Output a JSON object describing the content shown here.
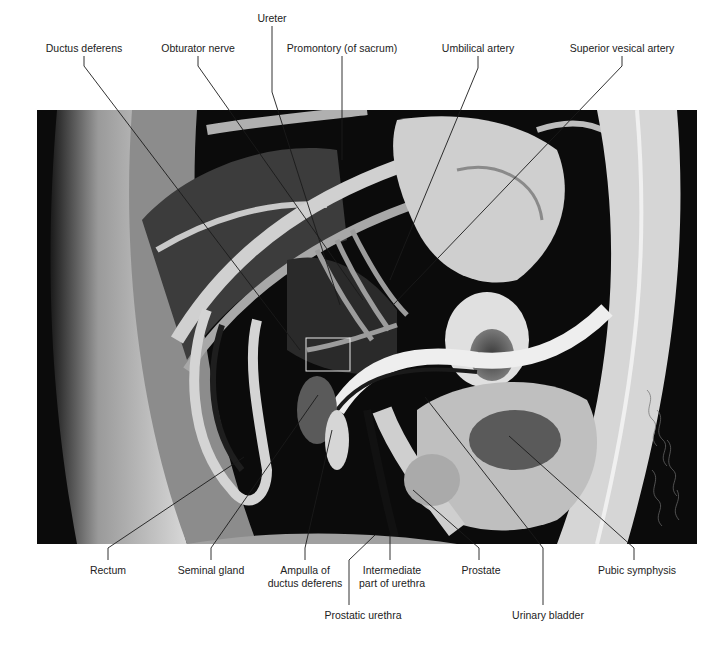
{
  "figure": {
    "type": "anatomical-photograph",
    "view": "median sagittal section of male pelvis",
    "labels_top": [
      {
        "id": "ductus-deferens",
        "text": "Ductus deferens",
        "x": 61,
        "y": 48
      },
      {
        "id": "obturator-nerve",
        "text": "Obturator nerve",
        "x": 198,
        "y": 48
      },
      {
        "id": "ureter",
        "text": "Ureter",
        "x": 272,
        "y": 18
      },
      {
        "id": "promontory",
        "text": "Promontory (of sacrum)",
        "x": 346,
        "y": 48
      },
      {
        "id": "umbilical-artery",
        "text": "Umbilical artery",
        "x": 479,
        "y": 48
      },
      {
        "id": "superior-vesical-artery",
        "text": "Superior vesical artery",
        "x": 626,
        "y": 48
      }
    ],
    "labels_bottom": [
      {
        "id": "rectum",
        "text": "Rectum",
        "x": 108,
        "y": 569
      },
      {
        "id": "seminal-gland",
        "text": "Seminal gland",
        "x": 211,
        "y": 569
      },
      {
        "id": "ampulla",
        "text": "Ampulla of",
        "text2": "ductus deferens",
        "x": 303,
        "y": 569
      },
      {
        "id": "prostatic-urethra",
        "text": "Prostatic urethra",
        "x": 363,
        "y": 614
      },
      {
        "id": "intermediate-urethra",
        "text": "Intermediate",
        "text2": "part of urethra",
        "x": 394,
        "y": 569
      },
      {
        "id": "prostate",
        "text": "Prostate",
        "x": 481,
        "y": 569
      },
      {
        "id": "urinary-bladder",
        "text": "Urinary bladder",
        "x": 548,
        "y": 614
      },
      {
        "id": "pubic-symphysis",
        "text": "Pubic symphysis",
        "x": 637,
        "y": 569
      }
    ]
  }
}
